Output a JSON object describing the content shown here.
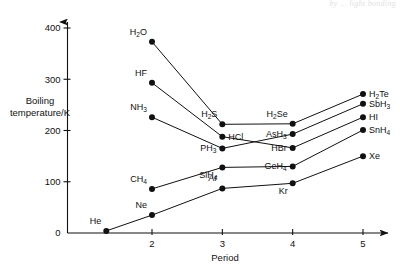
{
  "chart_data": {
    "type": "line",
    "title": "",
    "xlabel": "Period",
    "ylabel": "Boiling temperature/K",
    "ylabel_line1": "Boiling",
    "ylabel_line2": "temperature/K",
    "x": [
      2,
      3,
      4,
      5
    ],
    "xlim": [
      1.3,
      5.45
    ],
    "ylim": [
      0,
      430
    ],
    "xticks": [
      2,
      3,
      4,
      5
    ],
    "xtick_labels": [
      "2",
      "3",
      "4",
      "5"
    ],
    "yticks": [
      0,
      100,
      200,
      300,
      400
    ],
    "ytick_labels": [
      "0",
      "100",
      "200",
      "300",
      "400"
    ],
    "grid": false,
    "legend": "none",
    "annotations": [
      "Hydride boiling points by periodic group showing hydrogen bonding anomalies for H2O, HF and NH3"
    ],
    "series": [
      {
        "name": "Group 16 hydrides",
        "points": [
          {
            "label": "H2O",
            "formula": "H",
            "sub": "2",
            "tail": "O",
            "period": 2,
            "value": 373,
            "label_pos": "above-left"
          },
          {
            "label": "H2S",
            "formula": "H",
            "sub": "2",
            "tail": "S",
            "period": 3,
            "value": 212,
            "label_pos": "above-left"
          },
          {
            "label": "H2Se",
            "formula": "H",
            "sub": "2",
            "tail": "Se",
            "period": 4,
            "value": 213,
            "label_pos": "above-left"
          },
          {
            "label": "H2Te",
            "formula": "H",
            "sub": "2",
            "tail": "Te",
            "period": 5,
            "value": 271,
            "label_pos": "right"
          }
        ]
      },
      {
        "name": "Group 17 hydrides",
        "points": [
          {
            "label": "HF",
            "formula": "HF",
            "sub": "",
            "tail": "",
            "period": 2,
            "value": 293,
            "label_pos": "above-left"
          },
          {
            "label": "HCl",
            "formula": "HCl",
            "sub": "",
            "tail": "",
            "period": 3,
            "value": 188,
            "label_pos": "right"
          },
          {
            "label": "HBr",
            "formula": "HBr",
            "sub": "",
            "tail": "",
            "period": 4,
            "value": 166,
            "label_pos": "left"
          },
          {
            "label": "HI",
            "formula": "HI",
            "sub": "",
            "tail": "",
            "period": 5,
            "value": 226,
            "label_pos": "right"
          }
        ]
      },
      {
        "name": "Group 15 hydrides",
        "points": [
          {
            "label": "NH3",
            "formula": "NH",
            "sub": "3",
            "tail": "",
            "period": 2,
            "value": 226,
            "label_pos": "above-left"
          },
          {
            "label": "PH3",
            "formula": "PH",
            "sub": "3",
            "tail": "",
            "period": 3,
            "value": 165,
            "label_pos": "left"
          },
          {
            "label": "AsH3",
            "formula": "AsH",
            "sub": "3",
            "tail": "",
            "period": 4,
            "value": 193,
            "label_pos": "left"
          },
          {
            "label": "SbH3",
            "formula": "SbH",
            "sub": "3",
            "tail": "",
            "period": 5,
            "value": 252,
            "label_pos": "right"
          }
        ]
      },
      {
        "name": "Group 14 hydrides",
        "points": [
          {
            "label": "CH4",
            "formula": "CH",
            "sub": "4",
            "tail": "",
            "period": 2,
            "value": 86,
            "label_pos": "above-left"
          },
          {
            "label": "SiH4",
            "formula": "SiH",
            "sub": "4",
            "tail": "",
            "period": 3,
            "value": 128,
            "label_pos": "below-left"
          },
          {
            "label": "GeH4",
            "formula": "GeH",
            "sub": "4",
            "tail": "",
            "period": 4,
            "value": 130,
            "label_pos": "left"
          },
          {
            "label": "SnH4",
            "formula": "SnH",
            "sub": "4",
            "tail": "",
            "period": 5,
            "value": 201,
            "label_pos": "right"
          }
        ]
      },
      {
        "name": "Group 18 noble gases",
        "points": [
          {
            "label": "He",
            "formula": "He",
            "sub": "",
            "tail": "",
            "period": 1.35,
            "value": 4,
            "label_pos": "above-left"
          },
          {
            "label": "Ne",
            "formula": "Ne",
            "sub": "",
            "tail": "",
            "period": 2,
            "value": 35,
            "label_pos": "above-left"
          },
          {
            "label": "Ar",
            "formula": "Ar",
            "sub": "",
            "tail": "",
            "period": 3,
            "value": 87,
            "label_pos": "above-left"
          },
          {
            "label": "Kr",
            "formula": "Kr",
            "sub": "",
            "tail": "",
            "period": 4,
            "value": 97,
            "label_pos": "below-left"
          },
          {
            "label": "Xe",
            "formula": "Xe",
            "sub": "",
            "tail": "",
            "period": 5,
            "value": 150,
            "label_pos": "right"
          }
        ]
      }
    ]
  },
  "scan_artifact": {
    "text": "by ... light bonding"
  }
}
